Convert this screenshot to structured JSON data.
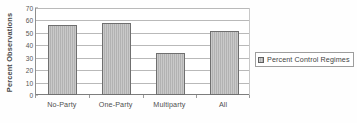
{
  "chart_data": {
    "type": "bar",
    "title": "",
    "xlabel": "",
    "ylabel": "Percent Observations",
    "categories": [
      "No-Party",
      "One-Party",
      "Multiparty",
      "All"
    ],
    "values": [
      56,
      58,
      34,
      51.5
    ],
    "series": [
      {
        "name": "Percent Control Regimes",
        "values": [
          56,
          58,
          34,
          51.5
        ]
      }
    ],
    "ylim": [
      0,
      70
    ],
    "ytick_step": 10,
    "yticks": [
      70,
      60,
      50,
      40,
      30,
      20,
      10,
      0
    ],
    "grid": true,
    "legend_position": "right",
    "bar_color": "#b2b2b2",
    "bar_edge_color": "#6f6f6f",
    "gridline_color": "#b9b9b9",
    "axis_color": "#7d7d7d"
  },
  "legend": {
    "entries": [
      {
        "label": "Percent Control Regimes",
        "swatch_icon": "hatched-square-swatch"
      }
    ]
  }
}
